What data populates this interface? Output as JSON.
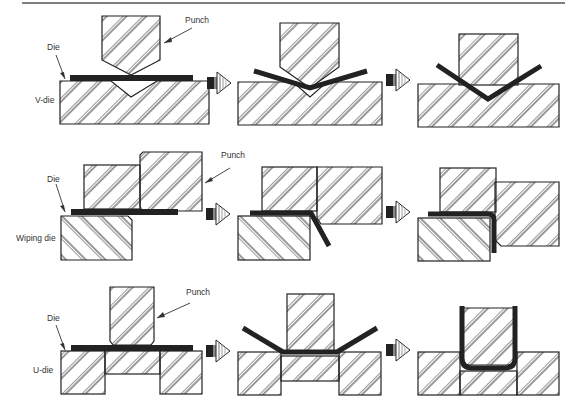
{
  "figure": {
    "rows": [
      {
        "name": "V-die",
        "die_type_label": "V-die",
        "die_label": "Die",
        "punch_label": "Punch",
        "stages": [
          "flat sheet on V-die, punch above",
          "sheet partially bent into V",
          "sheet fully bent into V"
        ]
      },
      {
        "name": "Wiping die",
        "die_type_label": "Wiping die",
        "die_label": "Die",
        "punch_label": "Punch",
        "stages": [
          "flat sheet clamped over die edge",
          "punch wipes sheet downward",
          "sheet bent 90 degrees around die edge"
        ]
      },
      {
        "name": "U-die",
        "die_type_label": "U-die",
        "die_label": "Die",
        "punch_label": "Punch",
        "stages": [
          "flat sheet across U-die gap",
          "sheet partially drawn into U",
          "sheet formed into U-channel around punch"
        ]
      }
    ],
    "arrow_icon": "process-arrow-icon",
    "colors": {
      "ink": "#222222",
      "background": "#ffffff",
      "rule": "#555555"
    }
  }
}
